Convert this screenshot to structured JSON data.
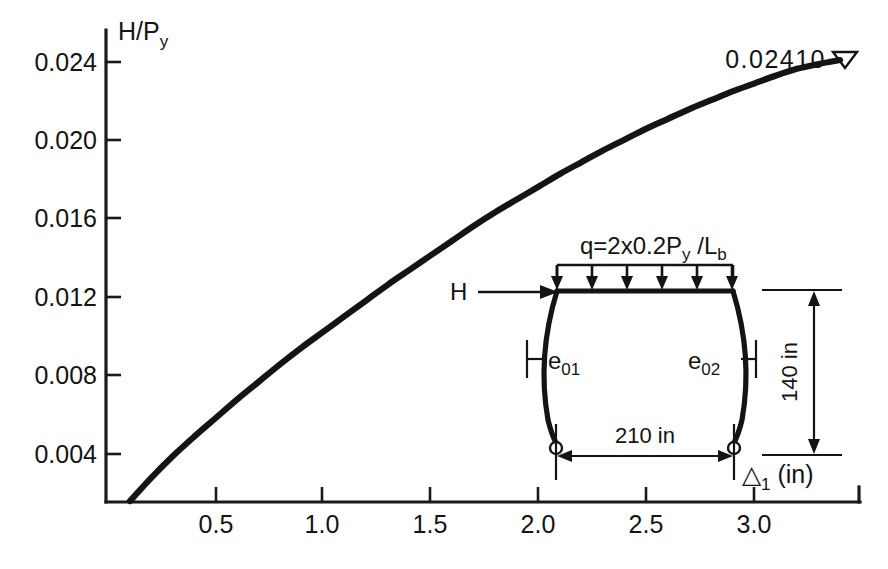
{
  "figure": {
    "background_color": "#ffffff",
    "ink_color": "#141414"
  },
  "chart_data": {
    "type": "line",
    "title": "",
    "subtitle": "",
    "xlabel": "Δ₁ (in)",
    "ylabel": "H/Pᵧ",
    "xlim": [
      0,
      3.4
    ],
    "ylim": [
      0,
      0.0255
    ],
    "grid": false,
    "legend": null,
    "xticks": [
      "0.5",
      "1.0",
      "1.5",
      "2.0",
      "2.5",
      "3.0"
    ],
    "xtick_values": [
      0.5,
      1.0,
      1.5,
      2.0,
      2.5,
      3.0
    ],
    "yticks": [
      "0.004",
      "0.008",
      "0.012",
      "0.016",
      "0.020",
      "0.024"
    ],
    "ytick_values": [
      0.004,
      0.008,
      0.012,
      0.016,
      0.02,
      0.024
    ],
    "series": [
      {
        "name": "H/Py vs Δ₁",
        "x": [
          0.1,
          0.2,
          0.3,
          0.4,
          0.5,
          0.6,
          0.7,
          0.8,
          0.9,
          1.0,
          1.1,
          1.2,
          1.3,
          1.4,
          1.5,
          1.6,
          1.7,
          1.8,
          1.9,
          2.0,
          2.1,
          2.2,
          2.3,
          2.4,
          2.5,
          2.6,
          2.7,
          2.8,
          2.9,
          3.0,
          3.1,
          3.2,
          3.3,
          3.4
        ],
        "values": [
          0.0016,
          0.0028,
          0.0039,
          0.0049,
          0.00585,
          0.0068,
          0.0077,
          0.0086,
          0.00945,
          0.01025,
          0.01105,
          0.01185,
          0.01265,
          0.0134,
          0.01415,
          0.0149,
          0.01565,
          0.01635,
          0.017,
          0.01765,
          0.0183,
          0.0189,
          0.0195,
          0.02005,
          0.0206,
          0.0211,
          0.0216,
          0.02205,
          0.0225,
          0.0229,
          0.0233,
          0.02365,
          0.0239,
          0.0241
        ]
      }
    ],
    "annotations": [
      {
        "text": "0.02410",
        "marker": "open-down-triangle",
        "at_x": 3.4,
        "at_y": 0.0241
      }
    ]
  },
  "axis": {
    "y_title": "H/P",
    "y_title_sub": "y",
    "x_title_symbol": "△",
    "x_title_sub": "1",
    "x_title_unit": "(in)"
  },
  "peak": {
    "value_label": "0.02410",
    "marker_glyph": "▽"
  },
  "inset": {
    "name": "portal-frame-schematic",
    "load_label": {
      "prefix": "q=2x0.2P",
      "sub1": "y",
      "mid": " /L",
      "sub2": "b"
    },
    "horizontal_force_label": "H",
    "imperfection_left": {
      "base": "e",
      "sub": "01"
    },
    "imperfection_right": {
      "base": "e",
      "sub": "02"
    },
    "height_dimension": "140 in",
    "span_dimension": "210 in"
  }
}
